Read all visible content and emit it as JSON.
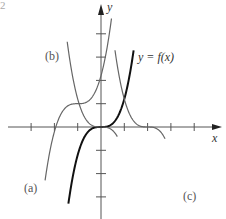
{
  "corner_mark": "2",
  "axes": {
    "x_label": "x",
    "y_label": "y",
    "origin_px": [
      101,
      127
    ],
    "unit_px": 23.3,
    "x_ticks": [
      -3,
      -2,
      -1,
      1,
      2,
      3,
      4
    ],
    "y_ticks": [
      4,
      3,
      2,
      1,
      -1,
      -2,
      -3
    ]
  },
  "labels": {
    "f": "y = f(x)",
    "a": "(a)",
    "b": "(b)",
    "c": "(c)"
  },
  "colors": {
    "axis": "#555555",
    "f_curve": "#111111",
    "transformed": "#666666"
  },
  "chart_data": {
    "type": "line",
    "title": "",
    "xlabel": "x",
    "ylabel": "y",
    "xlim": [
      -4,
      5
    ],
    "ylim": [
      -3.5,
      4.7
    ],
    "grid": false,
    "series": [
      {
        "name": "y = f(x)",
        "formula": "f(x) = x^3",
        "style": "bold",
        "x_range": [
          -1.4,
          1.4
        ]
      },
      {
        "name": "(a)",
        "formula": "f(x+1)+1",
        "style": "thin",
        "x_range": [
          -2.4,
          0.45
        ]
      },
      {
        "name": "(b)",
        "formula": "-f(x)",
        "style": "thin",
        "x_range": [
          -1.45,
          0.7
        ]
      },
      {
        "name": "(c)",
        "formula": "-f(x-2)",
        "style": "thin",
        "x_range": [
          0.6,
          2.75
        ]
      }
    ]
  }
}
